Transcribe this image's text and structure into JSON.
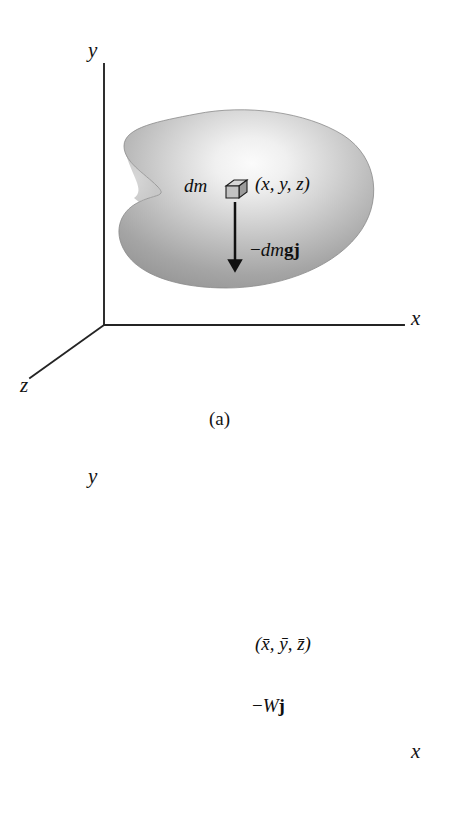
{
  "document": {
    "type": "textbook-figure",
    "subject": "center-of-gravity-of-a-rigid-body",
    "background_color": "#ffffff",
    "ink_color": "#141414"
  },
  "figures": [
    {
      "id": "figure-a",
      "caption": "(a)",
      "axes": {
        "y_label": "y",
        "x_label": "x",
        "z_label": "z"
      },
      "body": {
        "shape": "irregular-blob",
        "fill_light": "#f2f2f2",
        "fill_dark": "#8e8e8e",
        "edge": "#7e7e7e"
      },
      "marker": {
        "kind": "cube-icon",
        "name": "differential-mass-element"
      },
      "labels": {
        "mass_element": "dm",
        "coordinates": "(x, y, z)",
        "force_minus": "−",
        "force_dm": "dm",
        "force_g": "g",
        "force_j": "j",
        "force_full": "−dmgj"
      }
    },
    {
      "id": "figure-b",
      "caption": "(b)",
      "axes": {
        "y_label": "y",
        "x_label": "x",
        "z_label": ""
      },
      "body": {
        "shape": "irregular-blob",
        "fill_light": "#f2f2f2",
        "fill_dark": "#8e8e8e",
        "edge": "#7e7e7e"
      },
      "marker": {
        "kind": "centroid-icon",
        "name": "center-of-gravity"
      },
      "labels": {
        "coordinates": "(x̄, ȳ, z̄)",
        "force_minus": "−",
        "force_W": "W",
        "force_j": "j",
        "force_full": "−Wj"
      }
    }
  ]
}
